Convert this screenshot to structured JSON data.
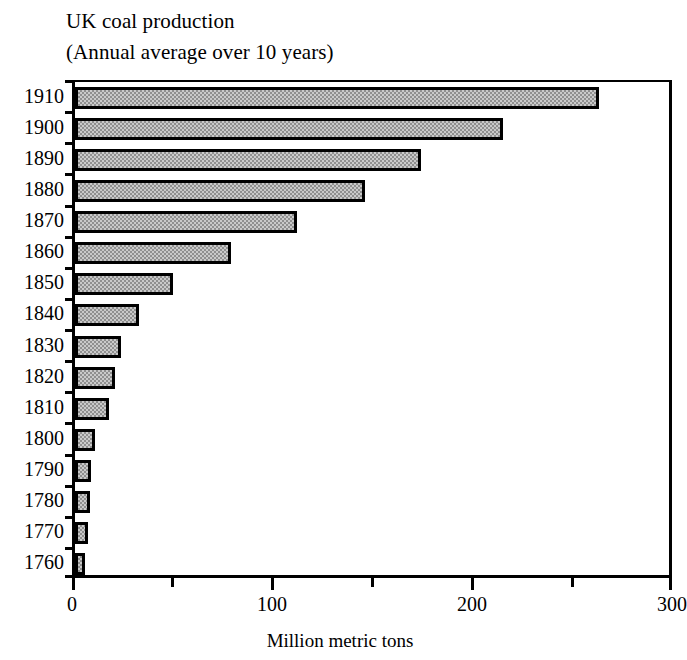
{
  "chart_data": {
    "type": "bar",
    "orientation": "horizontal",
    "title": "UK coal production",
    "subtitle": "(Annual average over 10 years)",
    "title_lines": [
      "UK coal production",
      "(Annual average over 10 years)"
    ],
    "xlabel": "Million metric tons",
    "ylabel": "",
    "categories": [
      "1910",
      "1900",
      "1890",
      "1880",
      "1870",
      "1860",
      "1850",
      "1840",
      "1830",
      "1820",
      "1810",
      "1800",
      "1790",
      "1780",
      "1770",
      "1760"
    ],
    "values": [
      262,
      214,
      173,
      145,
      111,
      78,
      49,
      32,
      23,
      20,
      17,
      10,
      8,
      7.5,
      6.5,
      5
    ],
    "xlim": [
      0,
      300
    ],
    "xticks": [
      0,
      50,
      100,
      150,
      200,
      250,
      300
    ],
    "xtick_labels": [
      "0",
      "",
      "100",
      "",
      "200",
      "",
      "300"
    ],
    "xtick_major": [
      0,
      100,
      200,
      300
    ],
    "xtick_minor": [
      50,
      150,
      250
    ],
    "grid": false,
    "legend": false,
    "bar_fill_color": "#c9c9c9",
    "bar_pattern": "checkered-stipple",
    "bar_border_color": "#000000",
    "background_color": "#ffffff"
  }
}
